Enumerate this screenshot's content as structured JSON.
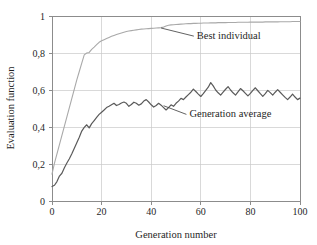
{
  "chart_data": {
    "type": "line",
    "title": "",
    "xlabel": "Generation number",
    "ylabel": "Evaluation function",
    "xlim": [
      0,
      100
    ],
    "ylim": [
      0,
      1
    ],
    "grid": true,
    "legend_position": "inline-annotations",
    "xticks": [
      0,
      20,
      40,
      60,
      80,
      100
    ],
    "xtick_labels": [
      "0",
      "20",
      "40",
      "60",
      "80",
      "100"
    ],
    "yticks": [
      0,
      0.2,
      0.4,
      0.6,
      0.8,
      1
    ],
    "ytick_labels": [
      "0",
      "0,2",
      "0,4",
      "0,6",
      "0,8",
      "1"
    ],
    "decimal_separator": ",",
    "annotations": [
      {
        "text": "Best individual",
        "points_to_x": 44,
        "points_to_y": 0.935,
        "label_x": 58,
        "label_y": 0.875
      },
      {
        "text": "Generation average",
        "points_to_x": 45,
        "points_to_y": 0.515,
        "label_x": 55,
        "label_y": 0.452
      }
    ],
    "series": [
      {
        "name": "Best individual",
        "color": "#a9a9a9",
        "line_width": 1.1,
        "x": [
          0,
          1,
          2,
          3,
          4,
          5,
          6,
          7,
          8,
          9,
          10,
          11,
          12,
          13,
          14,
          15,
          16,
          17,
          18,
          19,
          20,
          21,
          22,
          23,
          24,
          25,
          26,
          27,
          28,
          29,
          30,
          31,
          32,
          33,
          34,
          35,
          36,
          37,
          38,
          39,
          40,
          41,
          42,
          43,
          44,
          45,
          46,
          47,
          48,
          49,
          50,
          51,
          52,
          53,
          54,
          55,
          56,
          57,
          58,
          59,
          60,
          61,
          62,
          63,
          64,
          65,
          66,
          67,
          68,
          69,
          70,
          71,
          72,
          73,
          74,
          75,
          76,
          77,
          78,
          79,
          80,
          81,
          82,
          83,
          84,
          85,
          86,
          87,
          88,
          89,
          90,
          91,
          92,
          93,
          94,
          95,
          96,
          97,
          98,
          99,
          100
        ],
        "values": [
          0.145,
          0.205,
          0.255,
          0.305,
          0.355,
          0.405,
          0.455,
          0.505,
          0.555,
          0.605,
          0.655,
          0.7,
          0.745,
          0.79,
          0.8,
          0.803,
          0.82,
          0.832,
          0.845,
          0.858,
          0.866,
          0.872,
          0.878,
          0.884,
          0.89,
          0.895,
          0.9,
          0.904,
          0.908,
          0.912,
          0.916,
          0.919,
          0.921,
          0.923,
          0.925,
          0.927,
          0.929,
          0.93,
          0.931,
          0.932,
          0.933,
          0.934,
          0.935,
          0.936,
          0.937,
          0.94,
          0.946,
          0.95,
          0.952,
          0.953,
          0.954,
          0.955,
          0.956,
          0.957,
          0.958,
          0.959,
          0.959,
          0.96,
          0.96,
          0.961,
          0.961,
          0.962,
          0.962,
          0.962,
          0.963,
          0.963,
          0.963,
          0.964,
          0.964,
          0.964,
          0.964,
          0.965,
          0.965,
          0.965,
          0.965,
          0.966,
          0.966,
          0.966,
          0.966,
          0.966,
          0.967,
          0.967,
          0.967,
          0.967,
          0.967,
          0.967,
          0.968,
          0.968,
          0.968,
          0.968,
          0.968,
          0.968,
          0.969,
          0.969,
          0.969,
          0.969,
          0.969,
          0.97,
          0.97,
          0.97,
          0.97
        ]
      },
      {
        "name": "Generation average",
        "color": "#5a5a5a",
        "line_width": 1.2,
        "x": [
          0,
          1,
          2,
          3,
          4,
          5,
          6,
          7,
          8,
          9,
          10,
          11,
          12,
          13,
          14,
          15,
          16,
          17,
          18,
          19,
          20,
          21,
          22,
          23,
          24,
          25,
          26,
          27,
          28,
          29,
          30,
          31,
          32,
          33,
          34,
          35,
          36,
          37,
          38,
          39,
          40,
          41,
          42,
          43,
          44,
          45,
          46,
          47,
          48,
          49,
          50,
          51,
          52,
          53,
          54,
          55,
          56,
          57,
          58,
          59,
          60,
          61,
          62,
          63,
          64,
          65,
          66,
          67,
          68,
          69,
          70,
          71,
          72,
          73,
          74,
          75,
          76,
          77,
          78,
          79,
          80,
          81,
          82,
          83,
          84,
          85,
          86,
          87,
          88,
          89,
          90,
          91,
          92,
          93,
          94,
          95,
          96,
          97,
          98,
          99,
          100
        ],
        "values": [
          0.078,
          0.085,
          0.105,
          0.135,
          0.15,
          0.18,
          0.205,
          0.228,
          0.255,
          0.285,
          0.315,
          0.345,
          0.378,
          0.398,
          0.412,
          0.395,
          0.418,
          0.435,
          0.452,
          0.468,
          0.48,
          0.492,
          0.505,
          0.512,
          0.52,
          0.528,
          0.516,
          0.522,
          0.53,
          0.535,
          0.528,
          0.512,
          0.522,
          0.534,
          0.528,
          0.518,
          0.525,
          0.54,
          0.548,
          0.535,
          0.52,
          0.508,
          0.516,
          0.528,
          0.518,
          0.505,
          0.492,
          0.505,
          0.52,
          0.512,
          0.528,
          0.54,
          0.555,
          0.548,
          0.562,
          0.575,
          0.588,
          0.605,
          0.592,
          0.578,
          0.565,
          0.58,
          0.598,
          0.615,
          0.64,
          0.622,
          0.6,
          0.585,
          0.572,
          0.588,
          0.604,
          0.618,
          0.6,
          0.585,
          0.572,
          0.59,
          0.608,
          0.596,
          0.582,
          0.568,
          0.582,
          0.598,
          0.612,
          0.596,
          0.58,
          0.566,
          0.58,
          0.598,
          0.586,
          0.572,
          0.588,
          0.602,
          0.588,
          0.574,
          0.56,
          0.548,
          0.562,
          0.578,
          0.562,
          0.548,
          0.556
        ]
      }
    ]
  },
  "axis": {
    "ylabel_text": "Evaluation function",
    "xlabel_text": "Generation number"
  }
}
